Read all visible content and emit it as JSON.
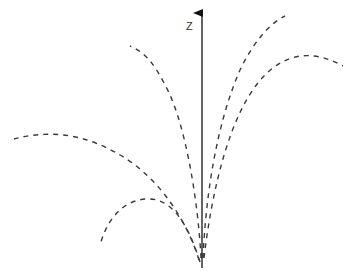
{
  "diagram": {
    "type": "trajectory-fan",
    "axis": {
      "label": "Z",
      "direction": "up"
    },
    "trajectory_count": 5,
    "trajectories": [
      {
        "id": "left-low-arc",
        "style": "dashed"
      },
      {
        "id": "left-wide-arc",
        "style": "dashed"
      },
      {
        "id": "left-steep",
        "style": "dashed"
      },
      {
        "id": "right-steep",
        "style": "dashed"
      },
      {
        "id": "right-wide-arc",
        "style": "dashed"
      }
    ],
    "colors": {
      "background": "#ffffff",
      "axis": "#111111",
      "trajectory": "#3a3a3a"
    }
  }
}
